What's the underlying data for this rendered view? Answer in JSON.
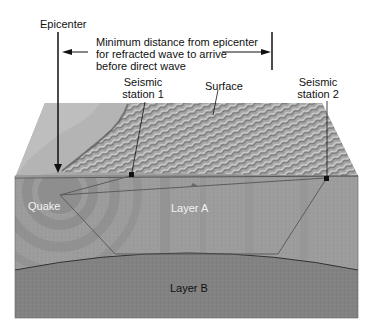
{
  "labels": {
    "epicenter": "Epicenter",
    "min_distance_line1": "Minimum distance from epicenter",
    "min_distance_line2": "for refracted wave to arrive",
    "min_distance_line3": "before direct wave",
    "station1_line1": "Seismic",
    "station1_line2": "station 1",
    "surface": "Surface",
    "station2_line1": "Seismic",
    "station2_line2": "station 2",
    "quake": "Quake",
    "layer_a": "Layer A",
    "layer_b": "Layer B"
  },
  "colors": {
    "background": "#ffffff",
    "layer_a": "#9a9a9a",
    "layer_b": "#7f7f7f",
    "surface_light": "#b8b8b8",
    "surface_dark": "#6e6e6e",
    "ink": "#111111",
    "wave_ring": "#808080",
    "ray": "#5a5a5a"
  },
  "diagram": {
    "type": "seismic refraction cross-section",
    "elements": [
      "epicenter marker",
      "quake source",
      "seismic station 1",
      "seismic station 2",
      "direct wave path",
      "refracted wave path",
      "layer A",
      "layer B",
      "surface terrain",
      "minimum distance arrow"
    ]
  }
}
